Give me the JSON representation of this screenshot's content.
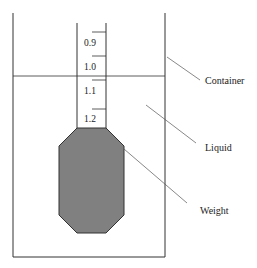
{
  "diagram": {
    "scale_labels": [
      "0.9",
      "1.0",
      "1.1",
      "1.2"
    ],
    "labels": {
      "container": "Container",
      "liquid": "Liquid",
      "weight": "Weight"
    },
    "colors": {
      "weight_fill": "#808080",
      "line": "#333333"
    }
  }
}
